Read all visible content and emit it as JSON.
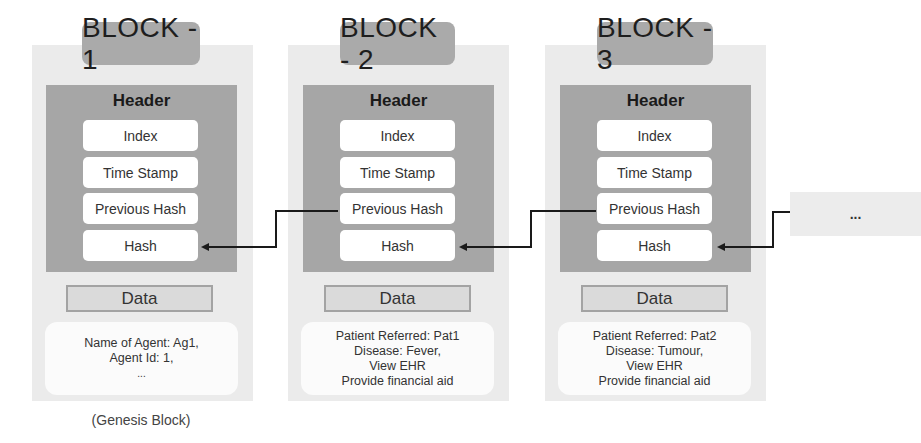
{
  "diagram": {
    "blocks": [
      {
        "title": "BLOCK - 1",
        "header": {
          "title": "Header",
          "fields": [
            "Index",
            "Time Stamp",
            "Previous Hash",
            "Hash"
          ]
        },
        "data_label": "Data",
        "data_lines": [
          "Name of Agent: Ag1,",
          "Agent Id: 1,",
          "..."
        ],
        "caption": "(Genesis Block)"
      },
      {
        "title": "BLOCK - 2",
        "header": {
          "title": "Header",
          "fields": [
            "Index",
            "Time Stamp",
            "Previous Hash",
            "Hash"
          ]
        },
        "data_label": "Data",
        "data_lines": [
          "Patient Referred: Pat1",
          "Disease: Fever,",
          "View EHR",
          "Provide financial aid"
        ]
      },
      {
        "title": "BLOCK - 3",
        "header": {
          "title": "Header",
          "fields": [
            "Index",
            "Time Stamp",
            "Previous Hash",
            "Hash"
          ]
        },
        "data_label": "Data",
        "data_lines": [
          "Patient Referred: Pat2",
          "Disease: Tumour,",
          "View EHR",
          "Provide financial aid"
        ]
      }
    ],
    "continuation": "...",
    "colors": {
      "block_bg": "#ebebeb",
      "title_pill": "#aaaaaa",
      "header_bg": "#a6a6a6",
      "field_bg": "#ffffff",
      "data_label_bg": "#dadada",
      "connector": "#1a1a1a"
    }
  }
}
